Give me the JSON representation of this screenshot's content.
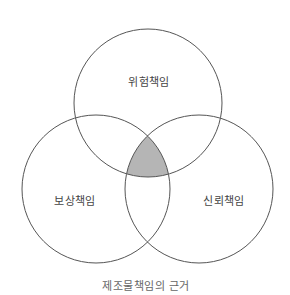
{
  "diagram": {
    "type": "venn",
    "caption": "제조물책임의 근거",
    "sets": [
      {
        "id": "risk",
        "label": "위험책임",
        "cx": 148,
        "cy": 103,
        "r": 74
      },
      {
        "id": "compensation",
        "label": "보상책임",
        "cx": 96,
        "cy": 189,
        "r": 74
      },
      {
        "id": "reliance",
        "label": "신뢰책임",
        "cx": 199,
        "cy": 189,
        "r": 74
      }
    ],
    "highlighted_region": "intersection of 위험책임, 보상책임, 신뢰책임",
    "colors": {
      "stroke": "#555555",
      "highlight_fill": "#b5b5b5",
      "background": "#ffffff"
    }
  }
}
